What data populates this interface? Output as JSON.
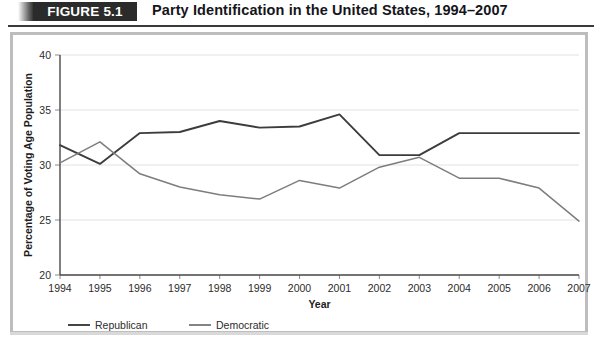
{
  "header": {
    "badge": "FIGURE 5.1",
    "title": "Party Identification in the United States, 1994–2007"
  },
  "chart_data": {
    "type": "line",
    "title": "Party Identification in the United States, 1994–2007",
    "xlabel": "Year",
    "ylabel": "Percentage of Voting Age Population",
    "x": [
      "1994",
      "1995",
      "1996",
      "1997",
      "1998",
      "1999",
      "2000",
      "2001",
      "2002",
      "2003",
      "2004",
      "2005",
      "2006",
      "2007"
    ],
    "categories": [
      "1994",
      "1995",
      "1996",
      "1997",
      "1998",
      "1999",
      "2000",
      "2001",
      "2002",
      "2003",
      "2004",
      "2005",
      "2006",
      "2007"
    ],
    "xlim": [
      1994,
      2007
    ],
    "ylim": [
      20,
      40
    ],
    "yticks": [
      20,
      25,
      30,
      35,
      40
    ],
    "grid": true,
    "legend_position": "bottom-left",
    "series": [
      {
        "name": "Republican",
        "color": "#3c3c3c",
        "values": [
          31.8,
          30.1,
          32.9,
          33.0,
          34.0,
          33.4,
          33.5,
          34.6,
          30.9,
          30.9,
          32.9,
          32.9,
          32.9,
          32.9
        ]
      },
      {
        "name": "Democratic",
        "color": "#7d7d7d",
        "values": [
          30.2,
          32.1,
          29.2,
          28.0,
          27.3,
          26.9,
          28.6,
          27.9,
          29.8,
          30.7,
          28.8,
          28.8,
          27.9,
          24.9
        ]
      }
    ]
  },
  "legend": {
    "items": [
      {
        "label": "Republican",
        "color": "#3c3c3c"
      },
      {
        "label": "Democratic",
        "color": "#7d7d7d"
      }
    ]
  }
}
